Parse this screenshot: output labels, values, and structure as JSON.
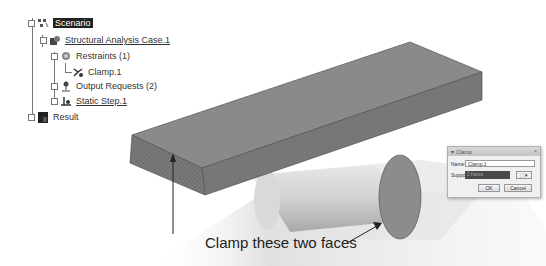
{
  "tree": {
    "items": [
      {
        "label": "Scenario",
        "level": 0,
        "selected": true,
        "underline": false,
        "icon": "scenario-icon"
      },
      {
        "label": "Structural Analysis Case.1",
        "level": 1,
        "selected": false,
        "underline": true,
        "icon": "analysis-case-icon"
      },
      {
        "label": "Restraints (1)",
        "level": 2,
        "selected": false,
        "underline": false,
        "icon": "restraints-icon"
      },
      {
        "label": "Clamp.1",
        "level": 3,
        "selected": false,
        "underline": false,
        "icon": "clamp-icon"
      },
      {
        "label": "Output Requests (2)",
        "level": 2,
        "selected": false,
        "underline": false,
        "icon": "output-requests-icon"
      },
      {
        "label": "Static Step.1",
        "level": 2,
        "selected": false,
        "underline": true,
        "icon": "static-step-icon"
      },
      {
        "label": "Result",
        "level": 0,
        "selected": false,
        "underline": false,
        "icon": "result-icon"
      }
    ]
  },
  "dialog": {
    "title": "Clamp",
    "close_glyph": "×",
    "name_label": "Name:",
    "name_value": "Clamp.1",
    "support_label": "Support",
    "support_value": "2 Faces",
    "ok_label": "OK",
    "cancel_label": "Cancel"
  },
  "annotation": {
    "caption": "Clamp these two faces"
  },
  "colors": {
    "block_top": "#8a8a8a",
    "block_front": "#7b7b7b",
    "block_side": "#6e6e6e",
    "cylinder": "#c9c9c9",
    "cylinder_face": "#8c8c8c",
    "selected_bg": "#222222"
  }
}
